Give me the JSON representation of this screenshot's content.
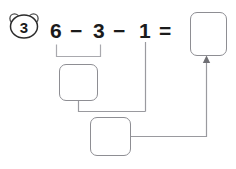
{
  "problem": {
    "number": "3",
    "number_badge_icon": "bear-head-icon",
    "equation": {
      "operand1": "6",
      "operator1": "−",
      "operand2": "3",
      "operator2": "−",
      "operand3": "1",
      "equals": "="
    }
  },
  "answer_boxes": {
    "result": "",
    "step1": "",
    "step2": ""
  },
  "annotations": {
    "grouping_bracket": "bracket-under-6-minus-3",
    "arrow": "arrow-up-into-result-box"
  },
  "colors": {
    "ink": "#1b1b1b",
    "box_stroke": "#8e8e93",
    "connector_stroke": "#9a9a9f",
    "background": "#ffffff"
  }
}
